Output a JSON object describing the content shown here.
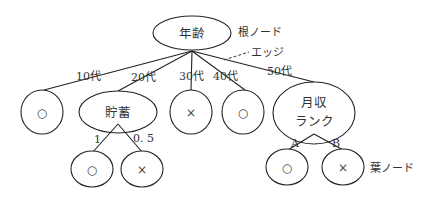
{
  "diagram": {
    "type": "decision-tree",
    "root": {
      "label": "年齢",
      "annotation": "根ノード"
    },
    "edge_annotation": "エッジ",
    "leaf_annotation": "葉ノード",
    "level1": [
      {
        "edge_label": "10代",
        "node_label": "○"
      },
      {
        "edge_label": "20代",
        "node_label": "貯蓄"
      },
      {
        "edge_label": "30代",
        "node_label": "×"
      },
      {
        "edge_label": "40代",
        "node_label": "○"
      },
      {
        "edge_label": "50代",
        "node_label_line1": "月収",
        "node_label_line2": "ランク"
      }
    ],
    "savings_children": [
      {
        "edge_label": "1",
        "node_label": "○"
      },
      {
        "edge_label": "0. 5",
        "node_label": "×"
      }
    ],
    "income_children": [
      {
        "edge_label": "A",
        "node_label": "○"
      },
      {
        "edge_label": "B",
        "node_label": "×"
      }
    ],
    "colors": {
      "line": "#222222",
      "text": "#333333",
      "background": "#ffffff"
    }
  }
}
